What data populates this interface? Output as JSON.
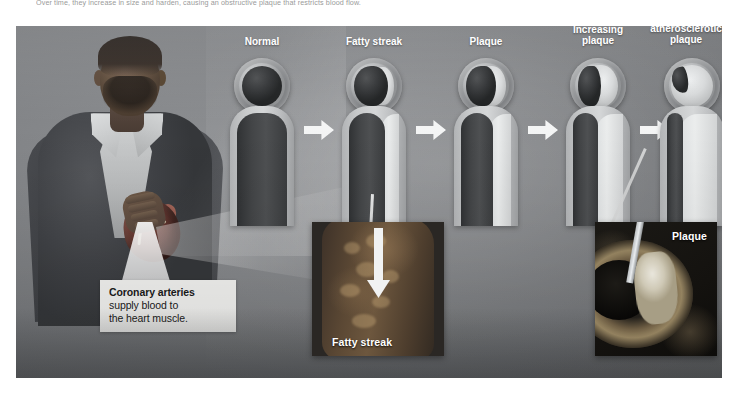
{
  "top_caption": "Over time, they increase in size and harden, causing an obstructive plaque that restricts blood flow.",
  "figure": {
    "subject_alt": "Man in dark suit holding an anatomical heart at his chest"
  },
  "callout": {
    "title": "Coronary arteries",
    "line1": "supply blood to",
    "line2": "the heart muscle."
  },
  "stages": [
    {
      "label": "Normal",
      "lumen_pct": 100,
      "plaque_pct": 0
    },
    {
      "label": "Fatty streak",
      "lumen_pct": 85,
      "plaque_pct": 15
    },
    {
      "label": "Plaque",
      "lumen_pct": 72,
      "plaque_pct": 28
    },
    {
      "label": "Increasing\nplaque",
      "lumen_pct": 55,
      "plaque_pct": 45
    },
    {
      "label": "Obstructive\natherosclerotic\nplaque",
      "lumen_pct": 18,
      "plaque_pct": 82
    }
  ],
  "stage_labels": {
    "s0": "Normal",
    "s1": "Fatty streak",
    "s2": "Plaque",
    "s3_line1": "Increasing",
    "s3_line2": "plaque",
    "s4_line1": "Obstructive",
    "s4_line2": "atherosclerotic",
    "s4_line3": "plaque"
  },
  "photos": {
    "fatty_streak_label": "Fatty streak",
    "plaque_label": "Plaque"
  },
  "colors": {
    "panel_bg": "#7d7f82",
    "lumen_dark": "#333537",
    "plaque_light": "#dcdedf",
    "arrow_white": "#f4f5f5",
    "callout_bg": "#f2f2f0",
    "label_text": "#ffffff"
  }
}
